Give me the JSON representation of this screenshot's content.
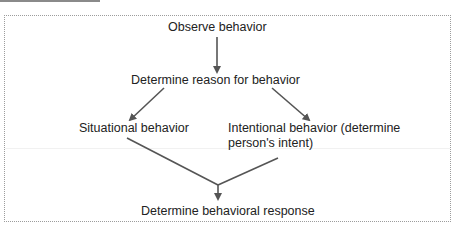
{
  "diagram": {
    "type": "flowchart",
    "nodes": {
      "observe": "Observe behavior",
      "reason": "Determine reason for behavior",
      "situational": "Situational behavior",
      "intentional_line1": "Intentional behavior (determine",
      "intentional_line2": "person's intent)",
      "response": "Determine behavioral response"
    },
    "edges": [
      {
        "from": "observe",
        "to": "reason"
      },
      {
        "from": "reason",
        "to": "situational"
      },
      {
        "from": "reason",
        "to": "intentional"
      },
      {
        "from": "situational",
        "to": "response"
      },
      {
        "from": "intentional",
        "to": "response"
      }
    ],
    "colors": {
      "line": "#555555",
      "text": "#222222",
      "border": "#9c9c9c"
    }
  }
}
